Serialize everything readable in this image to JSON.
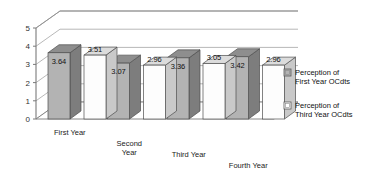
{
  "chart_data": {
    "type": "bar",
    "title": "",
    "xlabel": "",
    "ylabel": "",
    "ylim": [
      0,
      5
    ],
    "yticks": [
      0,
      1,
      2,
      3,
      4,
      5
    ],
    "grid": true,
    "projection": "3d-clustered-column",
    "legend_position": "right",
    "categories": [
      "First Year",
      "Second Year",
      "Third Year",
      "Fourth Year"
    ],
    "series": [
      {
        "name": "Perception of First Year OCdts",
        "values": [
          3.64,
          3.07,
          3.36,
          3.42
        ],
        "color": "#b3b3b3"
      },
      {
        "name": "Perception of Third Year OCdts",
        "values": [
          3.51,
          2.96,
          3.05,
          2.96
        ],
        "color": "#ffffff"
      }
    ],
    "data_labels": [
      "3.64",
      "3.51",
      "3.07",
      "2.96",
      "3.36",
      "3.05",
      "3.42",
      "2.96"
    ]
  },
  "axis": {
    "tick_labels": [
      "5",
      "4",
      "3",
      "2",
      "1",
      "0"
    ]
  },
  "categories_display": [
    {
      "line1": "First Year",
      "line2": ""
    },
    {
      "line1": "Second",
      "line2": "Year"
    },
    {
      "line1": "Third Year",
      "line2": ""
    },
    {
      "line1": "Fourth Year",
      "line2": ""
    }
  ],
  "legend": {
    "items": [
      {
        "line1": "Perception of",
        "line2": "First Year OCdts",
        "swatch": "#b3b3b3"
      },
      {
        "line1": "Perception of",
        "line2": "Third Year OCdts",
        "swatch": "#ffffff"
      }
    ]
  },
  "colors": {
    "series_gray": "#b3b3b3",
    "series_gray_top": "#8e8e8e",
    "series_gray_side": "#7d7d7d",
    "series_white": "#fdfdfd",
    "series_white_top": "#dcdcdc",
    "series_white_side": "#c9c9c9",
    "axis_line": "#7a7a7a",
    "grid_line": "#9a9a9a",
    "floor": "#ffffff",
    "text": "#1a1a1a"
  }
}
